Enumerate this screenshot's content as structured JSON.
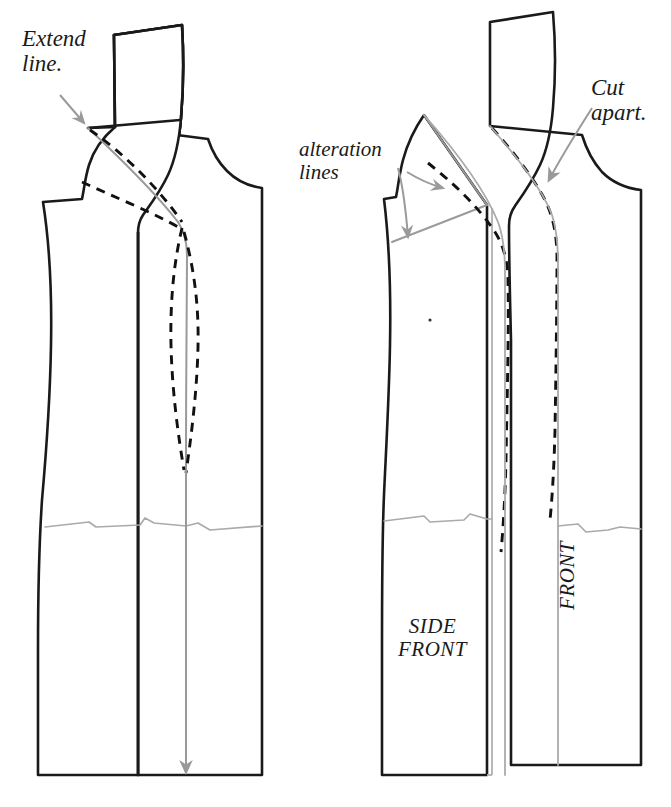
{
  "figure": {
    "type": "technical-illustration",
    "domain": "sewing-pattern"
  },
  "colors": {
    "outline": "#1a1a1a",
    "alteration_gray": "#999999",
    "dashed_black": "#111111",
    "background": "#ffffff",
    "text": "#1a1a1a"
  },
  "annotations": {
    "extend_line": "Extend\nline.",
    "alteration_lines": "alteration\nlines",
    "cut_apart": "Cut\napart.",
    "side_front": "SIDE\nFRONT",
    "front": "FRONT"
  },
  "panels": [
    {
      "id": "left-panel",
      "name": "unaltered-bodice-front",
      "description": "Whole bodice front with princess seam drawn, extend line arrow at shoulder, gray grainline with downward arrow at hem.",
      "elements": [
        "outline",
        "neck-extension",
        "gray-extend-line",
        "dashed-princess-seam",
        "gray-princess-seam",
        "gray-hem-line",
        "gray-grainline",
        "grainline-arrow"
      ]
    },
    {
      "id": "right-panel",
      "name": "altered-bodice-front-cut-apart",
      "description": "Bodice front separated into SIDE FRONT and FRONT pieces along the princess seam, showing gray alteration lines and cut-apart arrow.",
      "elements": [
        "side-front-piece",
        "front-piece",
        "gray-alteration-lines",
        "dashed-seam-lines",
        "gray-hem-line",
        "alteration-arrows",
        "cut-apart-arrow",
        "center-dot"
      ]
    }
  ]
}
